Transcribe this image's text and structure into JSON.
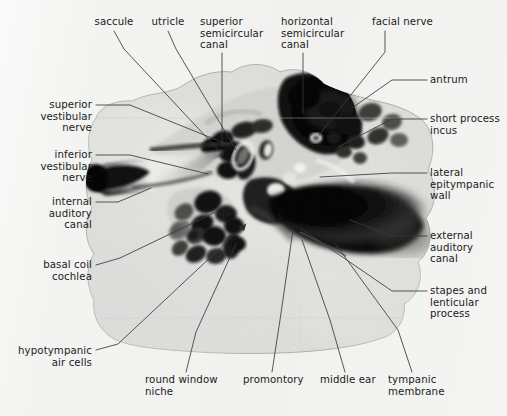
{
  "figure": {
    "type": "anatomical-radiograph",
    "caption": "",
    "colors": {
      "page_background": "#f2f2f0",
      "specimen_light": "#e2e2df",
      "specimen_dark": "#101010",
      "leader_line": "#3a3a3a",
      "label_text": "#1b1b1b"
    }
  },
  "labels": {
    "top": [
      {
        "id": "saccule",
        "text": "saccule",
        "align": "center",
        "x": 86,
        "y": 16,
        "w": 56,
        "leader": [
          [
            114,
            31
          ],
          [
            124,
            49
          ],
          [
            224,
            156
          ]
        ]
      },
      {
        "id": "utricle",
        "text": "utricle",
        "align": "center",
        "x": 142,
        "y": 16,
        "w": 52,
        "leader": [
          [
            168,
            31
          ],
          [
            176,
            49
          ],
          [
            236,
            150
          ]
        ]
      },
      {
        "id": "superior-semicircular-canal",
        "text": "superior\nsemicircular\ncanal",
        "align": "left",
        "x": 200,
        "y": 16,
        "w": 72,
        "leader": [
          [
            222,
            53
          ],
          [
            222,
            62
          ],
          [
            222,
            146
          ]
        ]
      },
      {
        "id": "horizontal-semicircular-canal",
        "text": "horizontal\nsemicircular\ncanal",
        "align": "left",
        "x": 281,
        "y": 16,
        "w": 72,
        "leader": [
          [
            303,
            53
          ],
          [
            303,
            62
          ],
          [
            303,
            113
          ]
        ]
      },
      {
        "id": "facial-nerve",
        "text": "facial nerve",
        "align": "left",
        "x": 372,
        "y": 16,
        "w": 66,
        "leader": [
          [
            385,
            31
          ],
          [
            385,
            52
          ],
          [
            319,
            135
          ]
        ]
      }
    ],
    "right": [
      {
        "id": "antrum",
        "text": "antrum",
        "align": "left",
        "x": 430,
        "y": 74,
        "w": 60,
        "leader": [
          [
            427,
            80
          ],
          [
            392,
            80
          ],
          [
            352,
            108
          ]
        ]
      },
      {
        "id": "short-process-incus",
        "text": "short process\nincus",
        "align": "left",
        "x": 430,
        "y": 113,
        "w": 72,
        "leader": [
          [
            427,
            119
          ],
          [
            392,
            119
          ],
          [
            338,
            147
          ]
        ]
      },
      {
        "id": "lateral-epitympanic-wall",
        "text": "lateral\nepitympanic\nwall",
        "align": "left",
        "x": 430,
        "y": 167,
        "w": 70,
        "leader": [
          [
            427,
            173
          ],
          [
            392,
            173
          ],
          [
            320,
            177
          ]
        ]
      },
      {
        "id": "external-auditory-canal",
        "text": "external\nauditory\ncanal",
        "align": "left",
        "x": 430,
        "y": 230,
        "w": 70,
        "leader": [
          [
            427,
            236
          ],
          [
            392,
            236
          ],
          [
            350,
            220
          ]
        ]
      },
      {
        "id": "stapes-and-lenticular-process",
        "text": "stapes and\nlenticular\nprocess",
        "align": "left",
        "x": 430,
        "y": 285,
        "w": 72,
        "leader": [
          [
            427,
            291
          ],
          [
            392,
            291
          ],
          [
            300,
            228
          ]
        ]
      }
    ],
    "left": [
      {
        "id": "superior-vestibular-nerve",
        "text": "superior\nvestibular\nnerve",
        "align": "right",
        "x": 22,
        "y": 99,
        "w": 70,
        "leader": [
          [
            96,
            105
          ],
          [
            130,
            105
          ],
          [
            224,
            143
          ]
        ]
      },
      {
        "id": "inferior-vestibular-nerve",
        "text": "inferior\nvestibular\nnerve",
        "align": "right",
        "x": 22,
        "y": 149,
        "w": 70,
        "leader": [
          [
            96,
            155
          ],
          [
            130,
            155
          ],
          [
            208,
            174
          ]
        ]
      },
      {
        "id": "internal-auditory-canal",
        "text": "internal\nauditory\ncanal",
        "align": "right",
        "x": 22,
        "y": 196,
        "w": 70,
        "leader": [
          [
            96,
            202
          ],
          [
            118,
            202
          ],
          [
            151,
            188
          ]
        ]
      },
      {
        "id": "basal-coil-cochlea",
        "text": "basal coil\ncochlea",
        "align": "right",
        "x": 22,
        "y": 259,
        "w": 70,
        "leader": [
          [
            96,
            265
          ],
          [
            120,
            258
          ],
          [
            218,
            211
          ]
        ]
      },
      {
        "id": "hypotympanic-air-cells",
        "text": "hypotympanic\nair cells",
        "align": "right",
        "x": 8,
        "y": 345,
        "w": 84,
        "leader": [
          [
            96,
            350
          ],
          [
            118,
            344
          ],
          [
            246,
            224
          ]
        ]
      }
    ],
    "bottom": [
      {
        "id": "round-window-niche",
        "text": "round window\nniche",
        "align": "left",
        "x": 145,
        "y": 374,
        "w": 80,
        "leader": [
          [
            186,
            372
          ],
          [
            196,
            332
          ],
          [
            236,
            244
          ]
        ]
      },
      {
        "id": "promontory",
        "text": "promontory",
        "align": "left",
        "x": 243,
        "y": 374,
        "w": 68,
        "leader": [
          [
            272,
            372
          ],
          [
            280,
            320
          ],
          [
            293,
            230
          ]
        ]
      },
      {
        "id": "middle-ear",
        "text": "middle ear",
        "align": "left",
        "x": 320,
        "y": 374,
        "w": 62,
        "leader": [
          [
            345,
            372
          ],
          [
            330,
            320
          ],
          [
            302,
            240
          ]
        ]
      },
      {
        "id": "tympanic-membrane",
        "text": "tympanic\nmembrane",
        "align": "left",
        "x": 388,
        "y": 374,
        "w": 72,
        "leader": [
          [
            412,
            372
          ],
          [
            398,
            330
          ],
          [
            334,
            242
          ]
        ]
      }
    ]
  }
}
